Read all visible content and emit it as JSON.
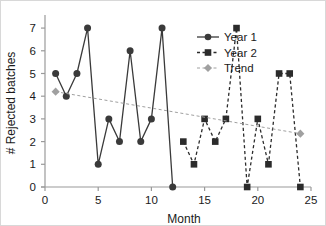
{
  "chart_data": {
    "type": "line",
    "title": "",
    "xlabel": "Month",
    "ylabel": "# Rejected batches",
    "xlim": [
      0,
      25
    ],
    "ylim": [
      0,
      7.4
    ],
    "xticks": [
      0,
      5,
      10,
      15,
      20,
      25
    ],
    "yticks": [
      0,
      1,
      2,
      3,
      4,
      5,
      6,
      7
    ],
    "xtick_labels": [
      "0",
      "5",
      "10",
      "15",
      "20",
      "25"
    ],
    "ytick_labels": [
      "0",
      "1",
      "2",
      "3",
      "4",
      "5",
      "6",
      "7"
    ],
    "grid": false,
    "legend_position": "upper right inside",
    "series": [
      {
        "name": "Year 1",
        "marker": "circle",
        "linestyle": "solid",
        "color": "#3a3a3a",
        "x": [
          1,
          2,
          3,
          4,
          5,
          6,
          7,
          8,
          9,
          10,
          11,
          12
        ],
        "values": [
          5,
          4,
          5,
          7,
          1,
          3,
          2,
          6,
          2,
          3,
          7,
          0
        ]
      },
      {
        "name": "Year 2",
        "marker": "square",
        "linestyle": "dashed",
        "color": "#2b2b2b",
        "x": [
          13,
          14,
          15,
          16,
          17,
          18,
          19,
          20,
          21,
          22,
          23,
          24
        ],
        "values": [
          2,
          1,
          3,
          2,
          3,
          7,
          0,
          3,
          1,
          5,
          5,
          0
        ]
      },
      {
        "name": "Trend",
        "marker": "diamond",
        "linestyle": "dashed",
        "color": "#a0a0a0",
        "x": [
          1,
          24
        ],
        "values": [
          4.2,
          2.35
        ]
      }
    ],
    "legend_entries": [
      {
        "label": "Year 1",
        "marker": "circle",
        "linestyle": "solid",
        "color": "#3a3a3a"
      },
      {
        "label": "Year 2",
        "marker": "square",
        "linestyle": "dashed",
        "color": "#2b2b2b"
      },
      {
        "label": "Trend",
        "marker": "diamond",
        "linestyle": "dashed",
        "color": "#a0a0a0"
      }
    ]
  },
  "axes": {
    "x_title": "Month",
    "y_title": "# Rejected batches"
  },
  "legend": {
    "item_0_label": "Year 1",
    "item_1_label": "Year 2",
    "item_2_label": "Trend"
  },
  "xticks": {
    "t0": "0",
    "t1": "5",
    "t2": "10",
    "t3": "15",
    "t4": "20",
    "t5": "25"
  },
  "yticks": {
    "t0": "0",
    "t1": "1",
    "t2": "2",
    "t3": "3",
    "t4": "4",
    "t5": "5",
    "t6": "6",
    "t7": "7"
  }
}
